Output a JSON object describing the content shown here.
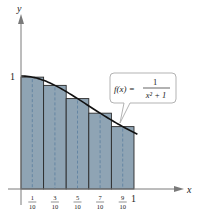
{
  "chart_data": {
    "type": "bar",
    "title": "",
    "xlabel": "x",
    "ylabel": "y",
    "xlim": [
      0,
      1
    ],
    "ylim": [
      0,
      1
    ],
    "grid": false,
    "function_label": {
      "lhs": "f(x) =",
      "numerator": "1",
      "denominator": "x² + 1"
    },
    "categories": [
      "1/10",
      "3/10",
      "5/10",
      "7/10",
      "9/10"
    ],
    "midpoints": [
      0.1,
      0.3,
      0.5,
      0.7,
      0.9
    ],
    "intervals": [
      [
        0,
        0.2
      ],
      [
        0.2,
        0.4
      ],
      [
        0.4,
        0.6
      ],
      [
        0.6,
        0.8
      ],
      [
        0.8,
        1.0
      ]
    ],
    "values": [
      0.99,
      0.917,
      0.8,
      0.671,
      0.552
    ],
    "x_ticks": [
      {
        "num": "1",
        "den": "10",
        "value": 0.1
      },
      {
        "num": "3",
        "den": "10",
        "value": 0.3
      },
      {
        "num": "5",
        "den": "10",
        "value": 0.5
      },
      {
        "num": "7",
        "den": "10",
        "value": 0.7
      },
      {
        "num": "9",
        "den": "10",
        "value": 0.9
      }
    ],
    "x_end_label": "1",
    "y_tick_label": "1",
    "colors": {
      "bar_fill": "#8fa4b4",
      "bar_edge": "#2a2a2a",
      "curve": "#111111",
      "midline": "#5a7fa0",
      "axis": "#7a7a7a"
    }
  }
}
